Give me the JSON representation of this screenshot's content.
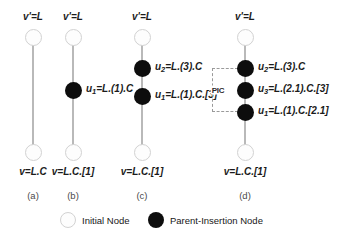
{
  "figure": {
    "columns": [
      {
        "caption": "(a)",
        "x": 33,
        "top_label": "v'=L",
        "bottom_label": "v=L.C",
        "nodes": [
          {
            "type": "initial",
            "y": 37
          },
          {
            "type": "initial",
            "y": 152
          }
        ],
        "side_labels": []
      },
      {
        "caption": "(b)",
        "x": 73,
        "top_label": "v'=L",
        "bottom_label": "v=L.C.[1]",
        "nodes": [
          {
            "type": "initial",
            "y": 37
          },
          {
            "type": "parent-insertion",
            "y": 90
          },
          {
            "type": "initial",
            "y": 152
          }
        ],
        "side_labels": [
          {
            "y": 90,
            "var": "u",
            "sub": "1",
            "rest": "=L.(1).C"
          }
        ]
      },
      {
        "caption": "(c)",
        "x": 142,
        "top_label": "v'=L",
        "bottom_label": "v=L.C.[1]",
        "nodes": [
          {
            "type": "initial",
            "y": 37
          },
          {
            "type": "parent-insertion",
            "y": 68
          },
          {
            "type": "parent-insertion",
            "y": 96
          },
          {
            "type": "initial",
            "y": 152
          }
        ],
        "side_labels": [
          {
            "y": 68,
            "var": "u",
            "sub": "2",
            "rest": "=L.(3).C"
          },
          {
            "y": 96,
            "var": "u",
            "sub": "1",
            "rest": "=L.(1).C.[3]"
          }
        ]
      },
      {
        "caption": "(d)",
        "x": 245,
        "top_label": "v'=L",
        "bottom_label": "v=L.C.[1]",
        "nodes": [
          {
            "type": "initial",
            "y": 37
          },
          {
            "type": "parent-insertion",
            "y": 68
          },
          {
            "type": "parent-insertion",
            "y": 90
          },
          {
            "type": "parent-insertion",
            "y": 112
          },
          {
            "type": "initial",
            "y": 152
          }
        ],
        "side_labels": [
          {
            "y": 68,
            "var": "u",
            "sub": "2",
            "rest": "=L.(3).C"
          },
          {
            "y": 90,
            "var": "u",
            "sub": "3",
            "rest": "=L.(2.1).C.[3]"
          },
          {
            "y": 112,
            "var": "u",
            "sub": "1",
            "rest": "=L.(1).C.[2.1]"
          }
        ],
        "group": {
          "label": "PIC",
          "top": 68,
          "bottom": 112
        }
      }
    ],
    "caption_y": 190,
    "top_label_y": 22,
    "bottom_label_y": 166
  },
  "legend": {
    "items": [
      {
        "swatch": "initial-node-swatch",
        "label": "Initial Node",
        "x": 60
      },
      {
        "swatch": "parent-insertion-node-swatch",
        "label": "Parent-Insertion Node",
        "x": 148
      }
    ]
  },
  "colors": {
    "initial_node_fill": "#fdfdfd",
    "initial_node_stroke": "#d2d2d2",
    "parent_insertion_node_fill": "#0d0d0d",
    "edge": "#b9b9b9",
    "bracket": "#9a9a9a",
    "text": "#1b1b1b",
    "caption_text": "#4a4a4a",
    "background": "#ffffff"
  }
}
